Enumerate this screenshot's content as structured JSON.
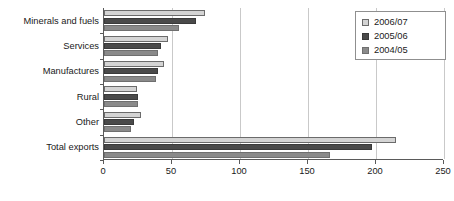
{
  "chart_data": {
    "type": "bar",
    "orientation": "horizontal",
    "title": "",
    "xlabel": "",
    "ylabel": "",
    "xlim": [
      0,
      250
    ],
    "xticks": [
      0,
      50,
      100,
      150,
      200,
      250
    ],
    "grid": true,
    "legend_position": "top-right",
    "categories": [
      "Minerals and fuels",
      "Services",
      "Manufactures",
      "Rural",
      "Other",
      "Total exports"
    ],
    "series": [
      {
        "name": "2006/07",
        "color": "#d4d4d4",
        "values": [
          74,
          47,
          44,
          24,
          27,
          215
        ]
      },
      {
        "name": "2005/06",
        "color": "#4a4a4a",
        "values": [
          68,
          42,
          40,
          25,
          22,
          197
        ]
      },
      {
        "name": "2004/05",
        "color": "#8a8a8a",
        "values": [
          55,
          40,
          38,
          25,
          20,
          166
        ]
      }
    ]
  },
  "legend": {
    "items": [
      {
        "label": "2006/07"
      },
      {
        "label": "2005/06"
      },
      {
        "label": "2004/05"
      }
    ]
  },
  "colors": {
    "series_2006_07": "#d4d4d4",
    "series_2005_06": "#4a4a4a",
    "series_2004_05": "#8a8a8a",
    "axis": "#5a5a5a",
    "gridline": "#c9c9c9",
    "background": "#ffffff"
  }
}
